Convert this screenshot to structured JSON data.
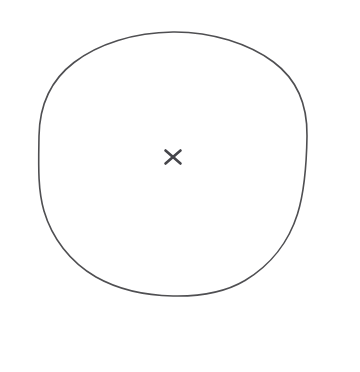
{
  "canvas": {
    "width": 360,
    "height": 372,
    "background_color": "#ffffff",
    "description": "Hand-drawn line drawing: a single large circle outline with a small x mark near its center"
  },
  "drawing": {
    "stroke_color": "#4f4f52",
    "mark_color": "#45454a",
    "shapes": [
      {
        "name": "circle-outline",
        "type": "circle",
        "center_x": 173,
        "center_y": 164,
        "radius_x": 134,
        "radius_y": 132,
        "stroke_width": 1.6,
        "fill": "none",
        "hand_drawn": true
      },
      {
        "name": "center-cross-mark",
        "type": "cross",
        "center_x": 173,
        "center_y": 157,
        "width": 15,
        "height": 13,
        "stroke_width": 2.6
      }
    ]
  }
}
